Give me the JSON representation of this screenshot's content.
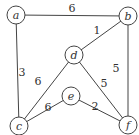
{
  "graph": {
    "nodes": [
      {
        "id": "a",
        "label": "a",
        "x": 16,
        "y": 15
      },
      {
        "id": "b",
        "label": "b",
        "x": 128,
        "y": 16
      },
      {
        "id": "d",
        "label": "d",
        "x": 74,
        "y": 55
      },
      {
        "id": "c",
        "label": "c",
        "x": 19,
        "y": 126
      },
      {
        "id": "e",
        "label": "e",
        "x": 71,
        "y": 96
      },
      {
        "id": "f",
        "label": "f",
        "x": 128,
        "y": 125
      }
    ],
    "edges": [
      {
        "from": "a",
        "to": "b",
        "weight": "6",
        "lx": 72,
        "ly": 12
      },
      {
        "from": "a",
        "to": "c",
        "weight": "3",
        "lx": 22,
        "ly": 76
      },
      {
        "from": "b",
        "to": "d",
        "weight": "1",
        "lx": 97,
        "ly": 34
      },
      {
        "from": "b",
        "to": "f",
        "weight": "5",
        "lx": 116,
        "ly": 72
      },
      {
        "from": "d",
        "to": "c",
        "weight": "6",
        "lx": 38,
        "ly": 85
      },
      {
        "from": "d",
        "to": "f",
        "weight": "5",
        "lx": 104,
        "ly": 87
      },
      {
        "from": "c",
        "to": "e",
        "weight": "6",
        "lx": 48,
        "ly": 111
      },
      {
        "from": "e",
        "to": "f",
        "weight": "2",
        "lx": 95,
        "ly": 110
      }
    ]
  }
}
